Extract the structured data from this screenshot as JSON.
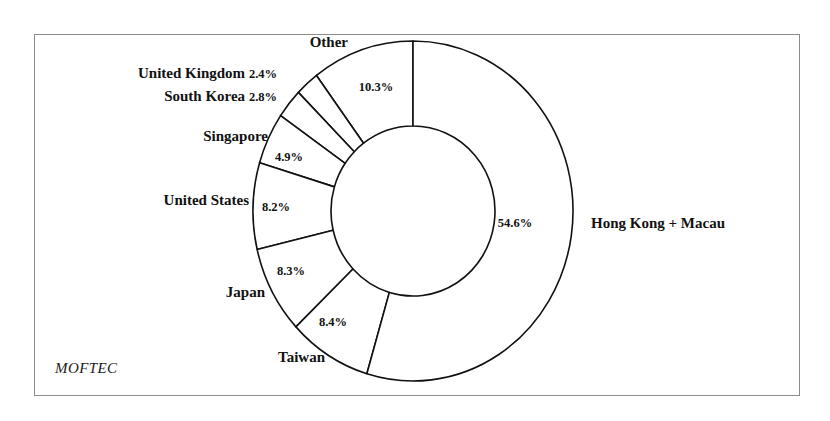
{
  "figure": {
    "source_label": "MOFTEC",
    "frame_color": "#8c8c8c",
    "line_color": "#111111",
    "background": "#ffffff"
  },
  "chart_data": {
    "type": "pie",
    "variant": "donut",
    "title": "",
    "subtitle": "",
    "xlabel": "",
    "ylabel": "",
    "grid": false,
    "legend": "none",
    "labels_outside": true,
    "value_suffix": "%",
    "start_angle_deg": 0,
    "direction": "counterclockwise",
    "inner_radius_ratio": 0.51,
    "categories": [
      "Other",
      "United Kingdom",
      "South Korea",
      "Singapore",
      "United States",
      "Japan",
      "Taiwan",
      "Hong Kong + Macau"
    ],
    "values": [
      10.3,
      2.4,
      2.8,
      4.9,
      8.2,
      8.3,
      8.4,
      54.6
    ],
    "value_labels": [
      "10.3%",
      "2.4%",
      "2.8%",
      "4.9%",
      "8.2%",
      "8.3%",
      "8.4%",
      "54.6%"
    ],
    "slices": [
      {
        "name": "Other",
        "value": 10.3,
        "value_label": "10.3%",
        "label_placement": "value-inside-ring",
        "category_anchor": "end",
        "category_x": 348,
        "category_y": 47,
        "value_x": 376,
        "value_y": 91
      },
      {
        "name": "United Kingdom",
        "value": 2.4,
        "value_label": "2.4%",
        "label_placement": "category-and-value-outside",
        "category_anchor": "end",
        "category_x": 277,
        "category_y": 78,
        "value_x": 279,
        "value_y": 78
      },
      {
        "name": "South Korea",
        "value": 2.8,
        "value_label": "2.8%",
        "label_placement": "category-and-value-outside",
        "category_anchor": "end",
        "category_x": 277,
        "category_y": 101,
        "value_x": 279,
        "value_y": 101
      },
      {
        "name": "Singapore",
        "value": 4.9,
        "value_label": "4.9%",
        "label_placement": "category-outside-value-inside",
        "category_anchor": "end",
        "category_x": 268,
        "category_y": 141,
        "value_x": 289,
        "value_y": 161
      },
      {
        "name": "United States",
        "value": 8.2,
        "value_label": "8.2%",
        "label_placement": "category-outside-value-inside",
        "category_anchor": "end",
        "category_x": 249,
        "category_y": 205,
        "value_x": 276,
        "value_y": 211
      },
      {
        "name": "Japan",
        "value": 8.3,
        "value_label": "8.3%",
        "label_placement": "category-outside-value-inside",
        "category_anchor": "end",
        "category_x": 265,
        "category_y": 297,
        "value_x": 291,
        "value_y": 275
      },
      {
        "name": "Taiwan",
        "value": 8.4,
        "value_label": "8.4%",
        "label_placement": "category-outside-value-inside",
        "category_anchor": "end",
        "category_x": 325,
        "category_y": 362,
        "value_x": 333,
        "value_y": 326
      },
      {
        "name": "Hong Kong + Macau",
        "value": 54.6,
        "value_label": "54.6%",
        "label_placement": "category-outside-value-inside",
        "category_anchor": "start",
        "category_x": 591,
        "category_y": 228,
        "value_x": 515,
        "value_y": 227
      }
    ],
    "geometry": {
      "center_x": 413,
      "center_y": 211,
      "outer_rx": 160,
      "outer_ry": 170,
      "inner_rx": 82,
      "inner_ry": 85
    },
    "total": 99.9
  }
}
